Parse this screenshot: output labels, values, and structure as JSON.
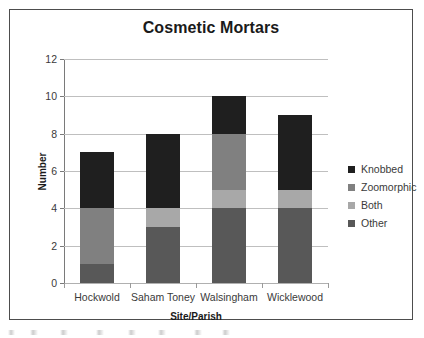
{
  "chart_data": {
    "type": "bar",
    "subtype": "stacked-bar",
    "title": "Cosmetic Mortars",
    "xlabel": "Site/Parish",
    "ylabel": "Number",
    "categories": [
      "Hockwold",
      "Saham Toney",
      "Walsingham",
      "Wicklewood"
    ],
    "series": [
      {
        "name": "Other",
        "values": [
          1,
          3,
          4,
          4
        ],
        "color": "#585858"
      },
      {
        "name": "Both",
        "values": [
          0,
          1,
          1,
          1
        ],
        "color": "#a8a8a8"
      },
      {
        "name": "Zoomorphic",
        "values": [
          3,
          0,
          3,
          0
        ],
        "color": "#808080"
      },
      {
        "name": "Knobbed",
        "values": [
          3,
          4,
          2,
          4
        ],
        "color": "#1f1f1f"
      }
    ],
    "totals": [
      7,
      8,
      10,
      9
    ],
    "ylim": [
      0,
      12
    ],
    "yticks": [
      0,
      2,
      4,
      6,
      8,
      10,
      12
    ],
    "ytick_labels": [
      "0",
      "2",
      "4",
      "6",
      "8",
      "10",
      "12"
    ],
    "grid": "horizontal",
    "legend_position": "right",
    "legend_order": [
      "Knobbed",
      "Zoomorphic",
      "Both",
      "Other"
    ]
  },
  "legend": {
    "items": [
      {
        "label": "Knobbed",
        "color": "#1f1f1f"
      },
      {
        "label": "Zoomorphic",
        "color": "#808080"
      },
      {
        "label": "Both",
        "color": "#a8a8a8"
      },
      {
        "label": "Other",
        "color": "#585858"
      }
    ]
  }
}
